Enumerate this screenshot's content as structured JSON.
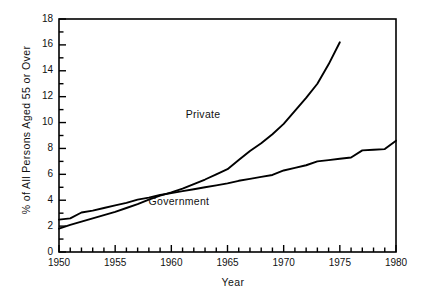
{
  "chart_data": {
    "type": "line",
    "title": "",
    "xlabel": "Year",
    "ylabel": "% of All Persons Aged 55 or Over",
    "xlim": [
      1950,
      1980
    ],
    "ylim": [
      0,
      18
    ],
    "xticks": [
      1950,
      1955,
      1960,
      1965,
      1970,
      1975,
      1980
    ],
    "yticks": [
      0,
      2,
      4,
      6,
      8,
      10,
      12,
      14,
      16,
      18
    ],
    "y_minor_step": 1,
    "x_minor_step": 1,
    "grid": false,
    "legend": "inline-annotations",
    "series": [
      {
        "name": "Private",
        "label_x": 1964.3,
        "label_y": 10.6,
        "x": [
          1950,
          1951,
          1952,
          1953,
          1954,
          1955,
          1956,
          1957,
          1958,
          1959,
          1960,
          1961,
          1962,
          1963,
          1964,
          1965,
          1966,
          1967,
          1968,
          1969,
          1970,
          1971,
          1972,
          1973,
          1974,
          1975
        ],
        "values": [
          1.8,
          2.1,
          2.35,
          2.6,
          2.85,
          3.1,
          3.4,
          3.7,
          4.05,
          4.35,
          4.6,
          4.9,
          5.25,
          5.6,
          6.0,
          6.4,
          7.1,
          7.8,
          8.4,
          9.1,
          9.9,
          10.9,
          11.9,
          13.0,
          14.5,
          16.2
        ]
      },
      {
        "name": "Government",
        "label_x": 1961.0,
        "label_y": 3.9,
        "x": [
          1950,
          1951,
          1952,
          1953,
          1954,
          1955,
          1956,
          1957,
          1958,
          1959,
          1960,
          1961,
          1962,
          1963,
          1964,
          1965,
          1966,
          1967,
          1968,
          1969,
          1970,
          1971,
          1972,
          1973,
          1974,
          1975,
          1976,
          1977,
          1978,
          1979,
          1980
        ],
        "values": [
          2.5,
          2.6,
          3.05,
          3.2,
          3.4,
          3.6,
          3.8,
          4.05,
          4.2,
          4.4,
          4.55,
          4.7,
          4.85,
          5.0,
          5.15,
          5.3,
          5.5,
          5.65,
          5.8,
          5.95,
          6.3,
          6.5,
          6.7,
          7.0,
          7.1,
          7.2,
          7.3,
          7.85,
          7.9,
          7.95,
          8.6
        ]
      }
    ]
  },
  "axes": {
    "x_tick_labels": [
      "1950",
      "1955",
      "1960",
      "1965",
      "1970",
      "1975",
      "1980"
    ],
    "y_tick_labels": [
      "0",
      "2",
      "4",
      "6",
      "8",
      "10",
      "12",
      "14",
      "16",
      "18"
    ],
    "x_axis_title": "Year",
    "y_axis_title": "% of All Persons Aged 55 or Over"
  },
  "annotations": {
    "private_label": "Private",
    "government_label": "Government"
  },
  "colors": {
    "line": "#000000",
    "axis": "#000000",
    "background": "#ffffff",
    "text": "#111111"
  }
}
